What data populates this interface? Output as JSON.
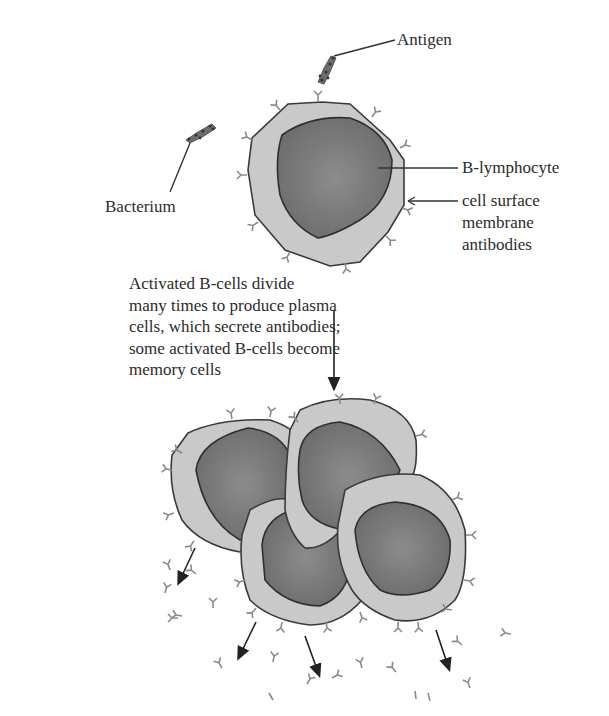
{
  "labels": {
    "antigen": "Antigen",
    "bacterium": "Bacterium",
    "b_lymphocyte": "B-lymphocyte",
    "surface_antibodies": [
      "cell surface",
      "membrane",
      "antibodies"
    ]
  },
  "caption": {
    "lines": [
      "Activated B-cells divide",
      "many times to produce plasma",
      "cells, which secrete antibodies;",
      "some activated B-cells become",
      "memory cells"
    ]
  },
  "colors": {
    "cytoplasm": "#c9c9c9",
    "nucleus": "#7a7a7a",
    "outline": "#3a3a3a",
    "antibody": "#8a8a8a",
    "bacterium": "#6e6e6e"
  }
}
